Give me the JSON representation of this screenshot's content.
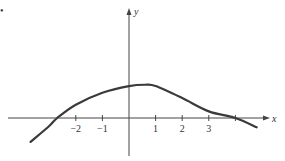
{
  "marker": "•",
  "chart_data": {
    "type": "line",
    "title": "",
    "xlabel": "x",
    "ylabel": "y",
    "x_ticks": [
      -2,
      -1,
      1,
      2,
      3
    ],
    "x_tick_labels": [
      "−2",
      "−1",
      "1",
      "2",
      "3"
    ],
    "xlim": [
      -4.0,
      5.0
    ],
    "ylim": [
      -1.5,
      4.3
    ],
    "grid": false,
    "legend": null,
    "series": [
      {
        "name": "curve",
        "x": [
          -3.7,
          -3.0,
          -2.7,
          -2.0,
          -1.0,
          0.0,
          0.6,
          1.0,
          2.0,
          3.0,
          4.0,
          4.8
        ],
        "y": [
          -0.9,
          -0.3,
          0.0,
          0.5,
          0.95,
          1.2,
          1.25,
          1.2,
          0.75,
          0.25,
          0.0,
          -0.35
        ]
      }
    ],
    "color": "#3a3a3a"
  }
}
